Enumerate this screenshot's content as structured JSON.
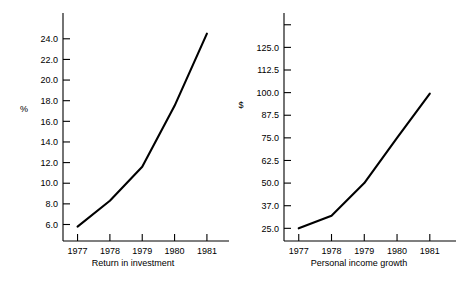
{
  "figure": {
    "background_color": "#ffffff",
    "ink_color": "#000000",
    "panel_count": 2
  },
  "chart_data": [
    {
      "type": "line",
      "panel": "left",
      "title": "",
      "xlabel": "Return in investment",
      "ylabel": "%",
      "x": [
        "1977",
        "1978",
        "1979",
        "1980",
        "1981"
      ],
      "categories": [
        "1977",
        "1978",
        "1979",
        "1980",
        "1981"
      ],
      "values": [
        5.8,
        8.3,
        11.6,
        17.5,
        24.5
      ],
      "series": [
        {
          "name": "Return in investment",
          "values": [
            5.8,
            8.3,
            11.6,
            17.5,
            24.5
          ]
        }
      ],
      "ytick_labels": [
        "6.0",
        "8.0",
        "10.0",
        "12.0",
        "14.0",
        "16.0",
        "18.0",
        "20.0",
        "22.0",
        "24.0"
      ],
      "ytick_values": [
        6.0,
        8.0,
        10.0,
        12.0,
        14.0,
        16.0,
        18.0,
        20.0,
        22.0,
        24.0
      ],
      "xtick_labels": [
        "1977",
        "1978",
        "1979",
        "1980",
        "1981"
      ],
      "ylim": [
        4.4,
        26.5
      ],
      "xlim": [
        1976.55,
        1981.25
      ],
      "grid": false,
      "legend": "none",
      "line_color": "#000000"
    },
    {
      "type": "line",
      "panel": "right",
      "title": "",
      "xlabel": "Personal income growth",
      "ylabel": "$",
      "x": [
        "1977",
        "1978",
        "1979",
        "1980",
        "1981"
      ],
      "categories": [
        "1977",
        "1978",
        "1979",
        "1980",
        "1981"
      ],
      "values": [
        25.0,
        32.0,
        50.0,
        75.0,
        99.5
      ],
      "series": [
        {
          "name": "Personal income growth",
          "values": [
            25.0,
            32.0,
            50.0,
            75.0,
            99.5
          ]
        }
      ],
      "ytick_labels": [
        "25.0",
        "37.0",
        "50.0",
        "62.5",
        "75.0",
        "87.5",
        "100.0",
        "112.5",
        "125.0",
        ""
      ],
      "ytick_values": [
        25.0,
        37.5,
        50.0,
        62.5,
        75.0,
        87.5,
        100.0,
        112.5,
        125.0,
        137.5
      ],
      "xtick_labels": [
        "1977",
        "1978",
        "1979",
        "1980",
        "1981"
      ],
      "ylim": [
        18.0,
        144.0
      ],
      "xlim": [
        1976.55,
        1981.25
      ],
      "grid": false,
      "legend": "none",
      "line_color": "#000000"
    }
  ]
}
